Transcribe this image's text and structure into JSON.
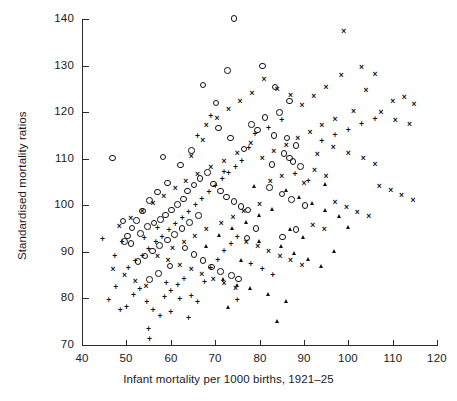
{
  "chart_data": {
    "type": "scatter",
    "title": "",
    "xlabel": "Infant mortality per 1000 births, 1921–25",
    "ylabel": "Standardised mortality ratios",
    "xlim": [
      40,
      120
    ],
    "ylim": [
      70,
      140
    ],
    "xticks": [
      40,
      50,
      60,
      70,
      80,
      90,
      100,
      110,
      120
    ],
    "yticks": [
      70,
      80,
      90,
      100,
      110,
      120,
      130,
      140
    ],
    "grid": false,
    "legend": "none",
    "marker_kinds": [
      "circle",
      "cross",
      "plus",
      "triangle"
    ],
    "series": [
      {
        "name": "circle",
        "marker": "circle",
        "points": [
          [
            74.0,
            140.3
          ],
          [
            46.6,
            110.4
          ],
          [
            67.0,
            126.0
          ],
          [
            72.5,
            129.2
          ],
          [
            80.4,
            130.1
          ],
          [
            83.3,
            125.6
          ],
          [
            86.6,
            122.6
          ],
          [
            84.3,
            120.1
          ],
          [
            81.0,
            119.1
          ],
          [
            78.0,
            117.6
          ],
          [
            79.3,
            116.4
          ],
          [
            83.0,
            115.2
          ],
          [
            86.0,
            114.7
          ],
          [
            88.0,
            113.0
          ],
          [
            85.3,
            111.3
          ],
          [
            86.5,
            110.4
          ],
          [
            87.3,
            109.6
          ],
          [
            89.0,
            108.5
          ],
          [
            82.6,
            109.0
          ],
          [
            76.3,
            112.3
          ],
          [
            73.2,
            114.7
          ],
          [
            70.6,
            116.8
          ],
          [
            64.4,
            112.0
          ],
          [
            62.0,
            108.9
          ],
          [
            59.0,
            105.0
          ],
          [
            56.8,
            103.1
          ],
          [
            55.0,
            101.2
          ],
          [
            53.4,
            99.0
          ],
          [
            52.0,
            97.0
          ],
          [
            51.0,
            95.3
          ],
          [
            50.0,
            93.6
          ],
          [
            49.3,
            92.4
          ],
          [
            53.0,
            94.2
          ],
          [
            54.6,
            95.6
          ],
          [
            56.0,
            96.4
          ],
          [
            57.4,
            97.2
          ],
          [
            58.6,
            98.1
          ],
          [
            60.0,
            99.2
          ],
          [
            61.3,
            100.4
          ],
          [
            62.6,
            101.6
          ],
          [
            63.6,
            103.3
          ],
          [
            65.0,
            104.6
          ],
          [
            66.4,
            106.0
          ],
          [
            68.0,
            107.2
          ],
          [
            69.4,
            104.8
          ],
          [
            71.0,
            103.3
          ],
          [
            72.4,
            102.0
          ],
          [
            74.0,
            101.0
          ],
          [
            75.6,
            100.0
          ],
          [
            77.2,
            99.2
          ],
          [
            66.0,
            98.0
          ],
          [
            64.0,
            96.5
          ],
          [
            62.3,
            95.2
          ],
          [
            60.6,
            94.0
          ],
          [
            59.0,
            92.8
          ],
          [
            57.3,
            91.6
          ],
          [
            55.6,
            90.4
          ],
          [
            54.0,
            89.3
          ],
          [
            52.4,
            88.2
          ],
          [
            50.8,
            92.0
          ],
          [
            49.0,
            96.8
          ],
          [
            63.0,
            91.0
          ],
          [
            65.0,
            89.6
          ],
          [
            67.0,
            88.4
          ],
          [
            69.0,
            87.0
          ],
          [
            71.0,
            86.0
          ],
          [
            73.4,
            85.2
          ],
          [
            75.0,
            84.4
          ],
          [
            59.6,
            87.2
          ],
          [
            57.0,
            85.6
          ],
          [
            55.0,
            84.3
          ],
          [
            82.0,
            104.0
          ],
          [
            84.8,
            102.6
          ],
          [
            87.0,
            101.4
          ],
          [
            90.0,
            100.2
          ],
          [
            79.0,
            95.2
          ],
          [
            77.0,
            93.2
          ],
          [
            88.0,
            95.0
          ],
          [
            85.0,
            93.4
          ],
          [
            70.0,
            122.2
          ],
          [
            58.0,
            110.6
          ]
        ]
      },
      {
        "name": "cross",
        "marker": "cross",
        "points": [
          [
            112.6,
            123.0
          ],
          [
            114.8,
            121.5
          ],
          [
            110.0,
            122.2
          ],
          [
            107.4,
            119.8
          ],
          [
            110.6,
            118.2
          ],
          [
            113.8,
            117.3
          ],
          [
            104.0,
            124.5
          ],
          [
            98.4,
            127.8
          ],
          [
            95.0,
            125.1
          ],
          [
            92.2,
            123.2
          ],
          [
            89.6,
            121.4
          ],
          [
            87.0,
            123.5
          ],
          [
            84.0,
            124.8
          ],
          [
            81.0,
            127.0
          ],
          [
            78.3,
            124.0
          ],
          [
            75.6,
            122.2
          ],
          [
            73.0,
            120.4
          ],
          [
            70.4,
            118.6
          ],
          [
            68.0,
            117.0
          ],
          [
            99.0,
            137.3
          ],
          [
            103.0,
            129.4
          ],
          [
            106.0,
            128.0
          ],
          [
            101.2,
            120.0
          ],
          [
            97.0,
            118.4
          ],
          [
            94.0,
            117.0
          ],
          [
            91.4,
            115.6
          ],
          [
            88.6,
            114.2
          ],
          [
            86.0,
            112.8
          ],
          [
            83.2,
            111.4
          ],
          [
            80.6,
            110.0
          ],
          [
            78.0,
            113.2
          ],
          [
            75.0,
            111.0
          ],
          [
            72.0,
            109.4
          ],
          [
            69.0,
            108.0
          ],
          [
            66.0,
            106.5
          ],
          [
            63.4,
            105.0
          ],
          [
            61.0,
            103.4
          ],
          [
            58.4,
            101.8
          ],
          [
            56.0,
            100.2
          ],
          [
            53.6,
            98.6
          ],
          [
            51.0,
            97.0
          ],
          [
            48.4,
            95.4
          ],
          [
            47.0,
            86.0
          ],
          [
            49.6,
            84.8
          ],
          [
            52.0,
            83.6
          ],
          [
            54.4,
            82.4
          ],
          [
            57.0,
            89.0
          ],
          [
            59.4,
            88.0
          ],
          [
            62.0,
            87.0
          ],
          [
            64.6,
            86.0
          ],
          [
            67.0,
            85.0
          ],
          [
            69.6,
            84.0
          ],
          [
            72.0,
            83.0
          ],
          [
            74.6,
            82.0
          ],
          [
            77.0,
            92.0
          ],
          [
            79.6,
            91.0
          ],
          [
            82.0,
            90.0
          ],
          [
            84.6,
            89.0
          ],
          [
            87.0,
            88.0
          ],
          [
            89.6,
            87.0
          ],
          [
            92.0,
            95.6
          ],
          [
            94.6,
            94.6
          ],
          [
            97.0,
            100.4
          ],
          [
            99.6,
            99.4
          ],
          [
            102.0,
            98.4
          ],
          [
            104.6,
            97.4
          ],
          [
            107.0,
            104.0
          ],
          [
            109.6,
            103.0
          ],
          [
            112.0,
            102.0
          ],
          [
            114.6,
            101.0
          ],
          [
            95.0,
            106.0
          ],
          [
            92.4,
            107.4
          ],
          [
            90.0,
            104.6
          ],
          [
            100.0,
            111.0
          ],
          [
            103.4,
            110.0
          ],
          [
            106.0,
            108.6
          ],
          [
            96.6,
            112.2
          ],
          [
            93.0,
            110.8
          ],
          [
            85.0,
            106.0
          ],
          [
            82.4,
            105.0
          ],
          [
            80.0,
            100.0
          ],
          [
            76.4,
            98.6
          ],
          [
            74.0,
            97.2
          ],
          [
            71.4,
            96.0
          ],
          [
            68.0,
            94.6
          ],
          [
            65.4,
            93.2
          ],
          [
            63.0,
            92.0
          ],
          [
            60.4,
            90.6
          ],
          [
            67.2,
            113.8
          ],
          [
            64.6,
            110.4
          ]
        ]
      },
      {
        "name": "plus",
        "marker": "plus",
        "points": [
          [
            44.6,
            92.6
          ],
          [
            46.0,
            79.4
          ],
          [
            47.6,
            82.3
          ],
          [
            48.6,
            77.4
          ],
          [
            50.0,
            78.0
          ],
          [
            51.6,
            80.6
          ],
          [
            53.0,
            81.8
          ],
          [
            54.6,
            79.0
          ],
          [
            56.0,
            77.2
          ],
          [
            57.6,
            76.0
          ],
          [
            55.0,
            73.2
          ],
          [
            55.2,
            71.0
          ],
          [
            58.6,
            80.0
          ],
          [
            60.0,
            81.4
          ],
          [
            61.6,
            82.6
          ],
          [
            63.0,
            84.0
          ],
          [
            64.6,
            80.2
          ],
          [
            66.0,
            79.0
          ],
          [
            67.6,
            83.4
          ],
          [
            69.0,
            86.4
          ],
          [
            70.6,
            88.0
          ],
          [
            72.0,
            90.0
          ],
          [
            73.6,
            91.4
          ],
          [
            75.0,
            93.0
          ],
          [
            50.4,
            86.4
          ],
          [
            52.0,
            87.8
          ],
          [
            53.6,
            89.0
          ],
          [
            55.0,
            90.4
          ],
          [
            56.6,
            91.8
          ],
          [
            58.0,
            93.0
          ],
          [
            59.6,
            94.4
          ],
          [
            61.0,
            95.8
          ],
          [
            62.6,
            97.0
          ],
          [
            64.0,
            98.4
          ],
          [
            65.6,
            99.8
          ],
          [
            67.0,
            101.2
          ],
          [
            68.6,
            102.6
          ],
          [
            70.0,
            104.0
          ],
          [
            71.6,
            105.4
          ],
          [
            73.0,
            106.8
          ],
          [
            74.6,
            108.0
          ],
          [
            76.0,
            109.4
          ],
          [
            66.0,
            114.6
          ],
          [
            69.0,
            119.0
          ],
          [
            72.0,
            107.0
          ],
          [
            77.6,
            112.0
          ],
          [
            79.0,
            115.0
          ],
          [
            82.0,
            116.4
          ],
          [
            85.0,
            118.0
          ],
          [
            88.0,
            106.4
          ],
          [
            91.0,
            105.0
          ],
          [
            94.0,
            113.6
          ],
          [
            97.0,
            114.8
          ],
          [
            100.0,
            116.0
          ],
          [
            103.0,
            117.2
          ],
          [
            106.0,
            118.4
          ],
          [
            78.0,
            87.2
          ],
          [
            80.6,
            86.0
          ],
          [
            83.0,
            84.8
          ],
          [
            75.0,
            79.4
          ],
          [
            64.0,
            75.6
          ],
          [
            60.0,
            76.8
          ],
          [
            49.0,
            92.0
          ],
          [
            47.4,
            89.0
          ],
          [
            59.0,
            83.0
          ],
          [
            62.0,
            79.6
          ],
          [
            57.0,
            95.0
          ],
          [
            54.0,
            92.8
          ]
        ]
      },
      {
        "name": "triangle",
        "marker": "triangle",
        "points": [
          [
            86.0,
            103.0
          ],
          [
            89.0,
            101.6
          ],
          [
            92.0,
            100.2
          ],
          [
            95.0,
            98.8
          ],
          [
            98.0,
            97.4
          ],
          [
            83.0,
            99.0
          ],
          [
            80.0,
            97.6
          ],
          [
            77.0,
            96.2
          ],
          [
            74.0,
            94.8
          ],
          [
            71.0,
            93.4
          ],
          [
            85.0,
            91.0
          ],
          [
            88.0,
            89.6
          ],
          [
            91.0,
            88.2
          ],
          [
            94.0,
            86.8
          ],
          [
            78.0,
            82.0
          ],
          [
            82.0,
            80.6
          ],
          [
            86.0,
            79.2
          ],
          [
            72.0,
            84.0
          ],
          [
            75.0,
            82.6
          ],
          [
            84.0,
            75.0
          ],
          [
            95.0,
            104.4
          ],
          [
            80.0,
            92.0
          ],
          [
            90.0,
            93.0
          ],
          [
            68.0,
            91.0
          ],
          [
            97.0,
            90.0
          ],
          [
            76.0,
            88.0
          ],
          [
            73.0,
            78.0
          ],
          [
            79.0,
            103.8
          ],
          [
            100.0,
            95.0
          ],
          [
            87.0,
            94.6
          ]
        ]
      }
    ]
  }
}
